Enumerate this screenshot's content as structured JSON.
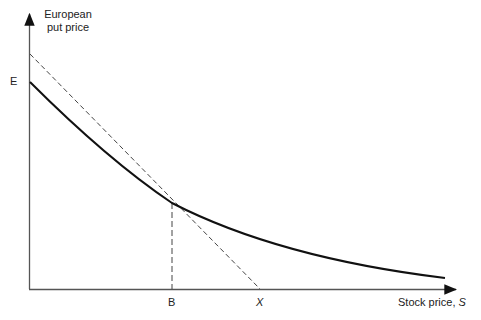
{
  "diagram": {
    "y_axis_label_line1": "European",
    "y_axis_label_line2": "put price",
    "x_axis_label": "Stock price, ",
    "x_axis_label_var": "S",
    "y_tick_label": "E",
    "x_tick_labels": {
      "b": "B",
      "x": "X"
    },
    "curves": [
      {
        "name": "european-put-price-curve",
        "style": "solid",
        "points": [
          [
            30,
            82
          ],
          [
            60,
            112
          ],
          [
            100,
            150
          ],
          [
            172,
            203
          ],
          [
            280,
            247
          ],
          [
            420,
            276
          ],
          [
            445,
            278
          ]
        ]
      },
      {
        "name": "intrinsic-value-line",
        "style": "dashed",
        "points": [
          [
            30,
            54
          ],
          [
            260,
            289
          ]
        ]
      },
      {
        "name": "b-vertical-line",
        "style": "dashed",
        "points": [
          [
            172,
            203
          ],
          [
            172,
            289
          ]
        ]
      }
    ],
    "colors": {
      "axis": "#555555",
      "curve": "#111111",
      "dashed": "#444444"
    }
  }
}
